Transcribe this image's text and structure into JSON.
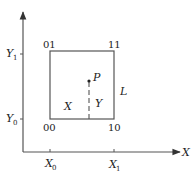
{
  "diagram": {
    "type": "coordinate-cell-diagram",
    "colors": {
      "stroke": "#555555",
      "text": "#222222",
      "background": "#ffffff"
    },
    "axes": {
      "x_label": "X",
      "y_label": "Y",
      "x_ticks": [
        {
          "base": "X",
          "sub": "0"
        },
        {
          "base": "X",
          "sub": "1"
        }
      ],
      "y_ticks": [
        {
          "base": "Y",
          "sub": "1"
        },
        {
          "base": "Y",
          "sub": "0"
        }
      ]
    },
    "cell": {
      "corners": {
        "top_left": "01",
        "top_right": "11",
        "bottom_left": "00",
        "bottom_right": "10"
      },
      "side_label": "L",
      "inner_x_label": "X",
      "inner_y_label": "Y"
    },
    "point": {
      "label": "P"
    }
  }
}
